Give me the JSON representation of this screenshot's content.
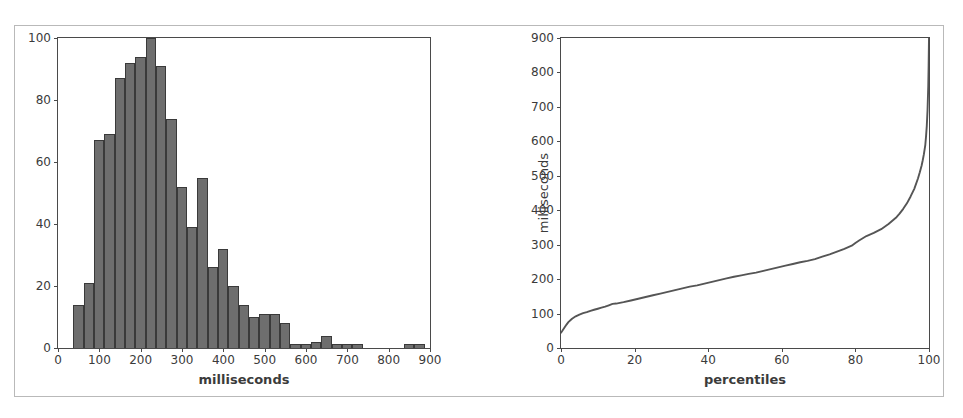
{
  "figure": {
    "panels": [
      "histogram-panel",
      "cdf-panel"
    ]
  },
  "chart_data": [
    {
      "id": "histogram",
      "type": "bar",
      "title": "",
      "xlabel": "milliseconds",
      "ylabel": "",
      "xlim": [
        0,
        900
      ],
      "ylim": [
        0,
        100
      ],
      "grid": false,
      "legend": false,
      "xticks": [
        0,
        100,
        200,
        300,
        400,
        500,
        600,
        700,
        800,
        900
      ],
      "xticklabels": [
        "0",
        "100",
        "200",
        "300",
        "400",
        "500",
        "600",
        "700",
        "800",
        "900"
      ],
      "yticks": [
        0,
        20,
        40,
        60,
        80,
        100
      ],
      "yticklabels": [
        "0",
        "20",
        "40",
        "60",
        "80",
        "100"
      ],
      "bin_width": 25,
      "bin_starts": [
        37,
        62,
        87,
        112,
        137,
        162,
        187,
        212,
        237,
        262,
        287,
        312,
        337,
        362,
        387,
        412,
        437,
        462,
        487,
        512,
        537,
        562,
        587,
        612,
        637,
        662,
        687,
        712,
        737,
        762,
        787,
        812,
        837,
        862
      ],
      "categories": [
        "37-62",
        "62-87",
        "87-112",
        "112-137",
        "137-162",
        "162-187",
        "187-212",
        "212-237",
        "237-262",
        "262-287",
        "287-312",
        "312-337",
        "337-362",
        "362-387",
        "387-412",
        "412-437",
        "437-462",
        "462-487",
        "487-512",
        "512-537",
        "537-562",
        "562-587",
        "587-612",
        "612-637",
        "637-662",
        "662-687",
        "687-712",
        "712-737",
        "737-762",
        "762-787",
        "787-812",
        "812-837",
        "837-862",
        "862-887"
      ],
      "values": [
        14,
        21,
        67,
        69,
        87,
        92,
        94,
        100,
        91,
        74,
        52,
        39,
        55,
        26,
        32,
        20,
        14,
        10,
        11,
        11,
        8,
        1,
        1,
        2,
        4,
        1,
        1,
        1,
        0,
        0,
        0,
        0,
        1,
        1
      ],
      "bar_color": "#6e6e6e",
      "bar_edge_color": "#3a3a3a"
    },
    {
      "id": "cdf",
      "type": "line",
      "title": "",
      "xlabel": "percentiles",
      "ylabel": "milliseconds",
      "xlim": [
        0,
        100
      ],
      "ylim": [
        0,
        900
      ],
      "grid": false,
      "legend": false,
      "xticks": [
        0,
        20,
        40,
        60,
        80,
        100
      ],
      "xticklabels": [
        "0",
        "20",
        "40",
        "60",
        "80",
        "100"
      ],
      "yticks": [
        0,
        100,
        200,
        300,
        400,
        500,
        600,
        700,
        800,
        900
      ],
      "yticklabels": [
        "0",
        "100",
        "200",
        "300",
        "400",
        "500",
        "600",
        "700",
        "800",
        "900"
      ],
      "line_color": "#555555",
      "series": [
        {
          "name": "latency percentile curve",
          "x": [
            0,
            0.5,
            1,
            1.5,
            2,
            3,
            4,
            5,
            6,
            7,
            8,
            9,
            10,
            11,
            12,
            13,
            14,
            15,
            17,
            19,
            21,
            23,
            25,
            27,
            29,
            31,
            33,
            35,
            37,
            39,
            41,
            43,
            45,
            47,
            49,
            51,
            53,
            55,
            57,
            59,
            61,
            63,
            65,
            67,
            69,
            71,
            73,
            75,
            77,
            79,
            80,
            81,
            83,
            85,
            87,
            89,
            91,
            92,
            93,
            94,
            95,
            96,
            97,
            97.5,
            98,
            98.3,
            98.6,
            99,
            99.2,
            99.4,
            99.6,
            99.8,
            99.9,
            100
          ],
          "values": [
            44,
            52,
            60,
            68,
            75,
            85,
            92,
            97,
            101,
            104,
            108,
            111,
            114,
            117,
            120,
            124,
            128,
            129,
            133,
            138,
            143,
            148,
            153,
            158,
            163,
            168,
            173,
            178,
            182,
            187,
            192,
            197,
            202,
            207,
            211,
            215,
            219,
            224,
            229,
            234,
            239,
            244,
            249,
            253,
            258,
            265,
            272,
            280,
            288,
            297,
            305,
            312,
            325,
            334,
            345,
            360,
            378,
            390,
            404,
            420,
            440,
            462,
            492,
            510,
            530,
            545,
            562,
            590,
            615,
            645,
            690,
            760,
            820,
            900
          ]
        }
      ]
    }
  ]
}
